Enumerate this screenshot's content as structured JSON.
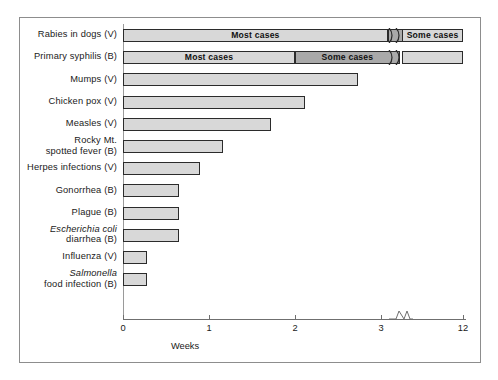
{
  "chart_data": {
    "type": "bar",
    "orientation": "horizontal",
    "title": "",
    "xlabel": "Weeks",
    "ylabel": "",
    "xlim": [
      0,
      12
    ],
    "grid": false,
    "axis_break": {
      "after": 3,
      "before": 12,
      "label": "axis-break"
    },
    "tick_labels": [
      "0",
      "1",
      "2",
      "3",
      "12"
    ],
    "tick_values": [
      0,
      1,
      2,
      3,
      12
    ],
    "categories": [
      "Rabies in dogs (V)",
      "Primary syphilis (B)",
      "Mumps (V)",
      "Chicken pox (V)",
      "Measles (V)",
      "Rocky Mt. spotted fever (B)",
      "Herpes infections (V)",
      "Gonorrhea (B)",
      "Plague (B)",
      "Escherichia coli diarrhea (B)",
      "Influenza (V)",
      "Salmonella food infection (B)"
    ],
    "values": [
      12,
      12,
      2.73,
      2.12,
      1.72,
      1.16,
      0.9,
      0.65,
      0.65,
      0.65,
      0.28,
      0.28
    ],
    "segment_labels": [
      "Most cases",
      "Some cases"
    ],
    "series": [
      {
        "name": "Most cases",
        "values": [
          3.2,
          2.0,
          2.73,
          2.12,
          1.72,
          1.16,
          0.9,
          0.65,
          0.65,
          0.65,
          0.28,
          0.28
        ]
      },
      {
        "name": "Some cases",
        "values": [
          12,
          12,
          0,
          0,
          0,
          0,
          0,
          0,
          0,
          0,
          0,
          0
        ]
      }
    ]
  },
  "rows": [
    {
      "label_lines": [
        "Rabies in dogs (V)"
      ],
      "italic_line": -1,
      "segments": [
        {
          "name": "most-cases",
          "start": 0,
          "end": 3.08,
          "shade": "light",
          "text": "Most cases"
        },
        {
          "name": "transition",
          "start": 3.08,
          "end": 3.28,
          "shade": "dark",
          "text": ""
        },
        {
          "name": "some-cases",
          "start": 3.45,
          "end": 12,
          "shade": "light",
          "text": "Some cases"
        }
      ]
    },
    {
      "label_lines": [
        "Primary syphilis (B)"
      ],
      "italic_line": -1,
      "segments": [
        {
          "name": "most-cases",
          "start": 0,
          "end": 2.0,
          "shade": "light",
          "text": "Most cases"
        },
        {
          "name": "some-cases",
          "start": 2.0,
          "end": 3.22,
          "shade": "dark",
          "text": "Some cases"
        },
        {
          "name": "tail",
          "start": 3.45,
          "end": 12,
          "shade": "light",
          "text": ""
        }
      ]
    },
    {
      "label_lines": [
        "Mumps (V)"
      ],
      "italic_line": -1,
      "segments": [
        {
          "name": "bar",
          "start": 0,
          "end": 2.73,
          "shade": "light",
          "text": ""
        }
      ]
    },
    {
      "label_lines": [
        "Chicken pox (V)"
      ],
      "italic_line": -1,
      "segments": [
        {
          "name": "bar",
          "start": 0,
          "end": 2.12,
          "shade": "light",
          "text": ""
        }
      ]
    },
    {
      "label_lines": [
        "Measles (V)"
      ],
      "italic_line": -1,
      "segments": [
        {
          "name": "bar",
          "start": 0,
          "end": 1.72,
          "shade": "light",
          "text": ""
        }
      ]
    },
    {
      "label_lines": [
        "Rocky Mt.",
        "spotted fever (B)"
      ],
      "italic_line": -1,
      "segments": [
        {
          "name": "bar",
          "start": 0,
          "end": 1.16,
          "shade": "light",
          "text": ""
        }
      ]
    },
    {
      "label_lines": [
        "Herpes infections (V)"
      ],
      "italic_line": -1,
      "segments": [
        {
          "name": "bar",
          "start": 0,
          "end": 0.9,
          "shade": "light",
          "text": ""
        }
      ]
    },
    {
      "label_lines": [
        "Gonorrhea (B)"
      ],
      "italic_line": -1,
      "segments": [
        {
          "name": "bar",
          "start": 0,
          "end": 0.65,
          "shade": "light",
          "text": ""
        }
      ]
    },
    {
      "label_lines": [
        "Plague (B)"
      ],
      "italic_line": -1,
      "segments": [
        {
          "name": "bar",
          "start": 0,
          "end": 0.65,
          "shade": "light",
          "text": ""
        }
      ]
    },
    {
      "label_lines": [
        "Escherichia coli",
        "diarrhea            (B)"
      ],
      "italic_line": 0,
      "segments": [
        {
          "name": "bar",
          "start": 0,
          "end": 0.65,
          "shade": "light",
          "text": ""
        }
      ]
    },
    {
      "label_lines": [
        "Influenza (V)"
      ],
      "italic_line": -1,
      "segments": [
        {
          "name": "bar",
          "start": 0,
          "end": 0.28,
          "shade": "light",
          "text": ""
        }
      ]
    },
    {
      "label_lines": [
        "Salmonella",
        "food infection (B)"
      ],
      "italic_line": 0,
      "segments": [
        {
          "name": "bar",
          "start": 0,
          "end": 0.28,
          "shade": "light",
          "text": ""
        }
      ]
    }
  ],
  "axis": {
    "x_title": "Weeks",
    "ticks": [
      {
        "label": "0",
        "value": 0
      },
      {
        "label": "1",
        "value": 1
      },
      {
        "label": "2",
        "value": 2
      },
      {
        "label": "3",
        "value": 3
      },
      {
        "label": "12",
        "value": 12
      }
    ]
  },
  "colors": {
    "bar_light": "#d8d8d8",
    "bar_dark": "#a9a9a9",
    "bar_border": "#2b2b2b",
    "axis": "#6f6f6f",
    "frame": "#8d8d8d",
    "text": "#1a1a1a",
    "background": "#ffffff"
  }
}
